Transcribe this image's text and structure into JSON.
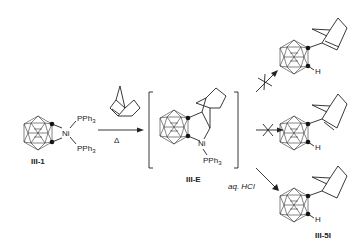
{
  "scheme": {
    "reactant": {
      "label": "III-1",
      "metal": "Ni",
      "ligand_top": "PPh",
      "ligand_top_sub": "3",
      "ligand_bottom": "PPh",
      "ligand_bottom_sub": "3"
    },
    "reaction_arrow": {
      "reagent": "norbornene",
      "condition": "Δ"
    },
    "intermediate": {
      "label": "III-E",
      "metal": "Ni",
      "ligand": "PPh",
      "ligand_sub": "3"
    },
    "products": [
      {
        "id": "top",
        "arrow": "crossed",
        "substituent": "norbornenyl",
        "h_label": "H",
        "label": ""
      },
      {
        "id": "middle",
        "arrow": "crossed",
        "substituent": "norbornenyl",
        "h_label": "H",
        "label": ""
      },
      {
        "id": "bottom",
        "arrow": "normal",
        "condition": "aq. HCl",
        "substituent": "norbornyl",
        "h_label": "H",
        "label": "III-5I"
      }
    ]
  }
}
